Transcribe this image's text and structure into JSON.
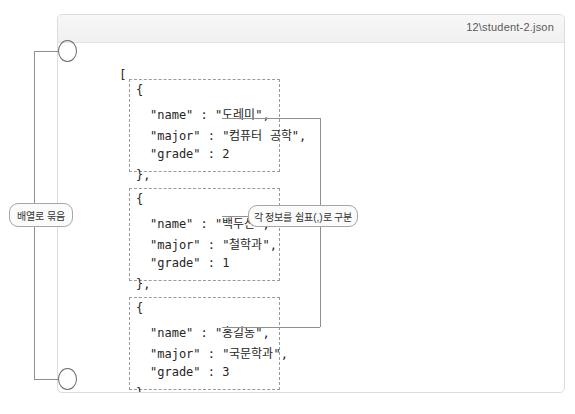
{
  "window": {
    "title": "12\\student-2.json"
  },
  "code": {
    "array_open": "[",
    "array_close": "]",
    "objects": [
      {
        "open": "{",
        "lines": [
          "\"name\" : \"도레미\",",
          "\"major\" : \"컴퓨터 공학\",",
          "\"grade\" : 2"
        ],
        "close": "},"
      },
      {
        "open": "{",
        "lines": [
          "\"name\" : \"백두산\",",
          "\"major\" : \"철학과\",",
          "\"grade\" : 1"
        ],
        "close": "},"
      },
      {
        "open": "{",
        "lines": [
          "\"name\" : \"홍길동\",",
          "\"major\" : \"국문학과\",",
          "\"grade\" : 3"
        ],
        "close": "}"
      }
    ]
  },
  "annotations": {
    "array_label": "배열로 묶음",
    "comma_label": "각 정보를 쉼표(,)로 구분"
  },
  "colors": {
    "panel_border": "#dcdcdc",
    "titlebar": "#f4f4f4",
    "dashed_border": "#9a9a9a",
    "connector": "#8f8f8f",
    "text": "#262626"
  }
}
